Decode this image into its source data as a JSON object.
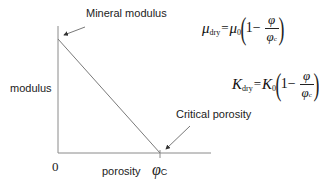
{
  "diagram": {
    "type": "critical-porosity-model",
    "labels": {
      "mineral_modulus": "Mineral modulus",
      "critical_porosity": "Critical porosity",
      "y_axis": "modulus",
      "x_axis": "porosity",
      "origin": "0",
      "phi_c_symbol": "φ",
      "phi_c_sub": "C"
    },
    "equations": {
      "shear": {
        "lhs_symbol": "μ",
        "lhs_sub": "dry",
        "equals": "=",
        "rhs_symbol": "μ",
        "rhs_sub": "0",
        "one": "1−",
        "num": "φ",
        "den_symbol": "φ",
        "den_sub": "c"
      },
      "bulk": {
        "lhs_symbol": "K",
        "lhs_sub": "dry",
        "equals": "=",
        "rhs_symbol": "K",
        "rhs_sub": "0",
        "one": "1−",
        "num": "φ",
        "den_symbol": "φ",
        "den_sub": "c"
      }
    },
    "colors": {
      "axis": "#888888",
      "line": "#777777",
      "text": "#222222"
    }
  }
}
